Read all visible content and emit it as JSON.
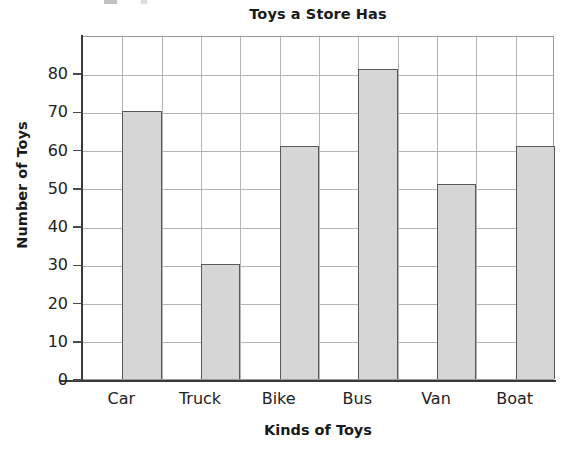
{
  "chart_data": {
    "type": "bar",
    "title": "Toys a Store Has",
    "xlabel": "Kinds of Toys",
    "ylabel": "Number of Toys",
    "categories": [
      "Car",
      "Truck",
      "Bike",
      "Bus",
      "Van",
      "Boat"
    ],
    "values": [
      70,
      30,
      61,
      81,
      51,
      61
    ],
    "ylim": [
      0,
      90
    ],
    "ytick_labels": [
      "0",
      "10",
      "20",
      "30",
      "40",
      "50",
      "60",
      "70",
      "80"
    ],
    "ytick_values": [
      0,
      10,
      20,
      30,
      40,
      50,
      60,
      70,
      80
    ],
    "grid": "horizontal gridlines at every 10 units and vertical gridlines at every half-category",
    "legend": "none",
    "bar_fill_color": "#d6d6d6",
    "bar_border_color": "#58585a",
    "gridline_color": "#b4b4b4",
    "axis_color": "#3a3a3a",
    "text_color": "#1a1a1a"
  }
}
